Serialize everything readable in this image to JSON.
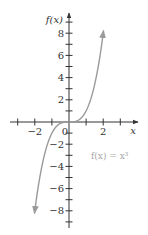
{
  "chart_data": {
    "type": "line",
    "title": "",
    "xlabel": "x",
    "ylabel": "f(x)",
    "annotation": "f(x) = x³",
    "function": "x^3",
    "xlim": [
      -3.5,
      4
    ],
    "ylim": [
      -9.5,
      9.5
    ],
    "x_ticks": [
      -3,
      -2,
      -1,
      0,
      1,
      2,
      3
    ],
    "x_tick_labels": [
      "-2",
      "2"
    ],
    "x_tick_label_values": [
      -2,
      2
    ],
    "y_ticks": [
      -9,
      -8,
      -7,
      -6,
      -5,
      -4,
      -3,
      -2,
      -1,
      1,
      2,
      3,
      4,
      5,
      6,
      7,
      8,
      9
    ],
    "y_tick_labels": [
      "8",
      "6",
      "4",
      "2",
      "−2",
      "−4",
      "−6",
      "−8"
    ],
    "y_tick_label_values": [
      8,
      6,
      4,
      2,
      -2,
      -4,
      -6,
      -8
    ],
    "origin_label": "0",
    "grid": false,
    "legend": "none",
    "series": [
      {
        "name": "f(x) = x³",
        "x": [
          -2,
          -1.5,
          -1,
          -0.5,
          0,
          0.5,
          1,
          1.5,
          2
        ],
        "y": [
          -8,
          -3.375,
          -1,
          -0.125,
          0,
          0.125,
          1,
          3.375,
          8
        ],
        "color": "#9a9a9a",
        "arrows_at_ends": true
      }
    ],
    "colors": {
      "axes": "#333333",
      "curve": "#9a9a9a",
      "annotation": "#a8a8a8"
    }
  }
}
